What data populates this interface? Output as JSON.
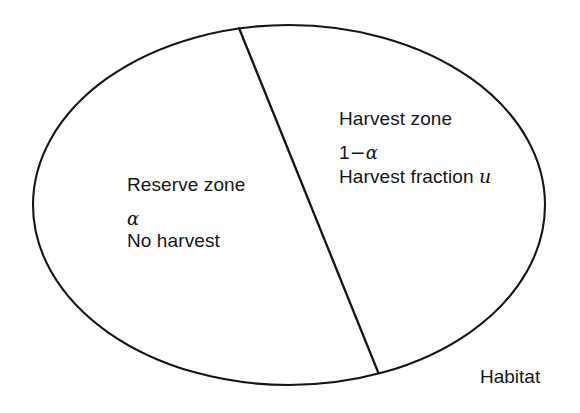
{
  "diagram": {
    "type": "conceptual-diagram",
    "title_label": "Habitat",
    "shape": "ellipse divided by a straight line into two zones",
    "colors": {
      "background": "#ffffff",
      "stroke": "#151515",
      "text": "#151515"
    },
    "geometry": {
      "ellipse": {
        "cx": 289,
        "cy": 205,
        "rx": 256,
        "ry": 180
      },
      "divider_line": {
        "x1": 239,
        "y1": 28,
        "x2": 378,
        "y2": 372
      }
    }
  },
  "reserve_zone": {
    "title": "Reserve zone",
    "fraction_symbol": "α",
    "description": "No harvest"
  },
  "harvest_zone": {
    "title": "Harvest zone",
    "fraction_prefix": "1",
    "fraction_minus": "−",
    "fraction_symbol": "α",
    "description_prefix": "Harvest fraction",
    "description_variable": "u"
  },
  "habitat": {
    "label": "Habitat"
  }
}
